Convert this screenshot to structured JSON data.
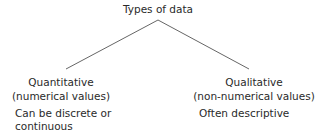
{
  "diagram": {
    "title": "Types of data",
    "left": {
      "heading": "Quantitative",
      "subheading": "(numerical values)",
      "description_line1": "Can be discrete or",
      "description_line2": "continuous"
    },
    "right": {
      "heading": "Qualitative",
      "subheading": "(non-numerical values)",
      "description_line1": "Often descriptive"
    },
    "line_color": "#666666"
  }
}
